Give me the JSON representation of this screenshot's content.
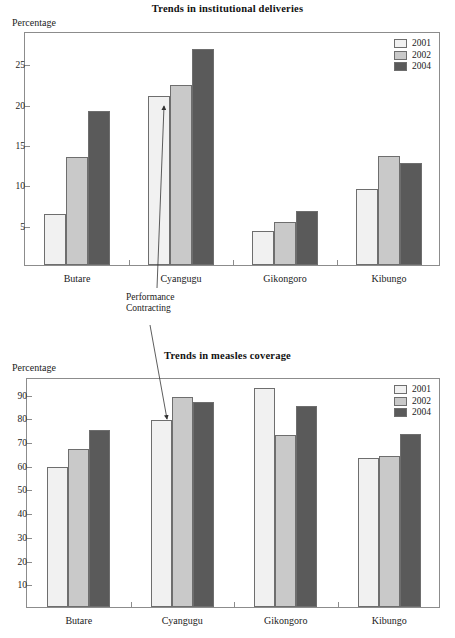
{
  "page": {
    "background": "#ffffff",
    "width": 455,
    "height": 638
  },
  "palette": {
    "series_2001": "#f1f1f1",
    "series_2002": "#c9c9c9",
    "series_2004": "#5a5a5a",
    "axis": "#8c8c8c",
    "text": "#1a1a1a"
  },
  "annotation": {
    "line1": "Performance",
    "line2": "Contracting"
  },
  "charts": [
    {
      "id": "institutional-deliveries",
      "title": "Trends in institutional deliveries",
      "ylabel": "Percentage"
    },
    {
      "id": "measles-coverage",
      "title": "Trends in measles coverage",
      "ylabel": "Percentage"
    }
  ],
  "chart_data": [
    {
      "type": "bar",
      "title": "Trends in institutional deliveries",
      "xlabel": "",
      "ylabel": "Percentage",
      "categories": [
        "Butare",
        "Cyangugu",
        "Gikongoro",
        "Kibungo"
      ],
      "series": [
        {
          "name": "2001",
          "color": "#f1f1f1",
          "values": [
            6.3,
            21.0,
            4.2,
            9.4
          ]
        },
        {
          "name": "2002",
          "color": "#c9c9c9",
          "values": [
            13.4,
            22.3,
            5.3,
            13.5
          ]
        },
        {
          "name": "2004",
          "color": "#5a5a5a",
          "values": [
            19.1,
            26.8,
            6.7,
            12.6
          ]
        }
      ],
      "ylim": [
        0,
        29
      ],
      "yticks": [
        5,
        10,
        15,
        20,
        25
      ],
      "ytick_labels": [
        "5",
        "10",
        "15",
        "20",
        "25"
      ],
      "grid": false,
      "legend_position": "top-right",
      "annotations": [
        {
          "text": "Performance Contracting",
          "points_to": "Cyangugu 2001 bar"
        }
      ]
    },
    {
      "type": "bar",
      "title": "Trends in measles coverage",
      "xlabel": "",
      "ylabel": "Percentage",
      "categories": [
        "Butare",
        "Cyangugu",
        "Gikongoro",
        "Kibungo"
      ],
      "series": [
        {
          "name": "2001",
          "color": "#f1f1f1",
          "values": [
            59.0,
            79.0,
            92.5,
            62.8
          ]
        },
        {
          "name": "2002",
          "color": "#c9c9c9",
          "values": [
            66.7,
            88.5,
            72.5,
            63.5
          ]
        },
        {
          "name": "2004",
          "color": "#5a5a5a",
          "values": [
            74.5,
            86.5,
            84.8,
            72.8
          ]
        }
      ],
      "ylim": [
        0,
        97
      ],
      "yticks": [
        10,
        20,
        30,
        40,
        50,
        60,
        70,
        80,
        90
      ],
      "ytick_labels": [
        "10",
        "20",
        "30",
        "40",
        "50",
        "60",
        "70",
        "80",
        "90"
      ],
      "grid": false,
      "legend_position": "top-right",
      "annotations": [
        {
          "text": "Performance Contracting",
          "points_to": "Cyangugu 2001 bar"
        }
      ]
    }
  ]
}
